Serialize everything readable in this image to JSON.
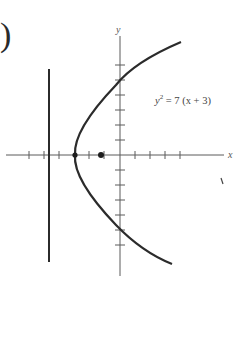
{
  "figure": {
    "part_label_fragment": ")",
    "equation": {
      "lhs": "y",
      "exponent": "2",
      "rhs": " = 7 (x + 3)"
    },
    "axes": {
      "x_label": "x",
      "y_label": "y",
      "unit_px": 15,
      "origin_px": [
        120,
        155
      ],
      "x_ticks": [
        -6,
        -5,
        -4,
        -3,
        -2,
        -1,
        1,
        2,
        3,
        4
      ],
      "y_ticks": [
        -6,
        -5,
        -4,
        -3,
        -2,
        -1,
        1,
        2,
        3,
        4,
        5,
        6
      ]
    },
    "parabola": {
      "equation": "y^2 = 7(x+3)",
      "vertex": [
        -3,
        0
      ],
      "focus": [
        -1.25,
        0
      ],
      "directrix_x": -4.75,
      "y_range": [
        -7,
        7.5
      ]
    },
    "colors": {
      "curve": "#2b2b2b",
      "axis": "#555555",
      "background": "#ffffff"
    }
  }
}
